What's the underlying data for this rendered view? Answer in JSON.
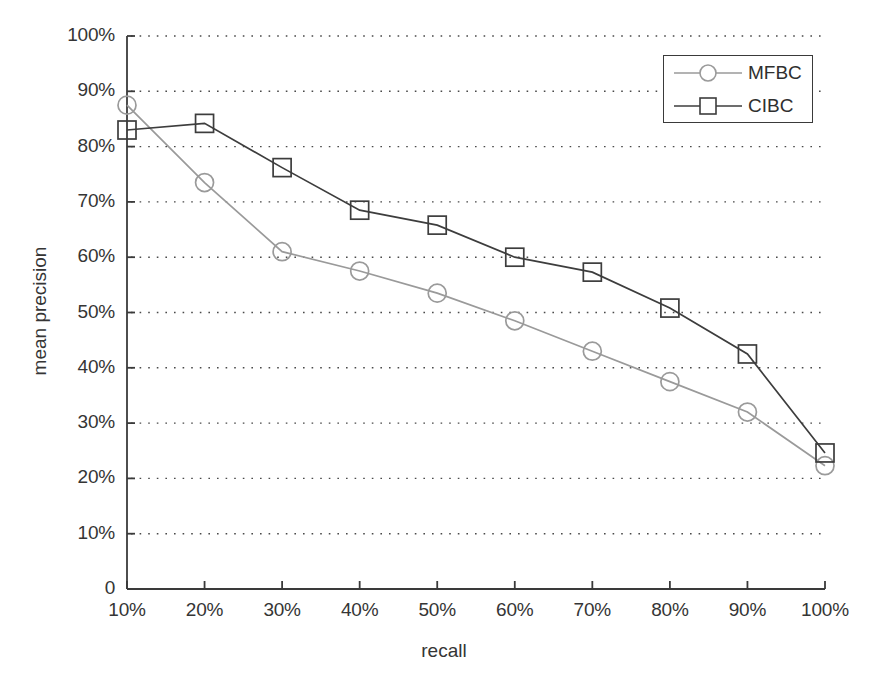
{
  "chart_data": {
    "type": "line",
    "title": "",
    "xlabel": "recall",
    "ylabel": "mean precision",
    "categories": [
      "10%",
      "20%",
      "30%",
      "40%",
      "50%",
      "60%",
      "70%",
      "80%",
      "90%",
      "100%"
    ],
    "x": [
      10,
      20,
      30,
      40,
      50,
      60,
      70,
      80,
      90,
      100
    ],
    "xlim": [
      10,
      100
    ],
    "ylim": [
      0,
      100
    ],
    "xtick_labels": [
      "10%",
      "20%",
      "30%",
      "40%",
      "50%",
      "60%",
      "70%",
      "80%",
      "90%",
      "100%"
    ],
    "ytick_labels": [
      "0",
      "10%",
      "20%",
      "30%",
      "40%",
      "50%",
      "60%",
      "70%",
      "80%",
      "90%",
      "100%"
    ],
    "ytick_values": [
      0,
      10,
      20,
      30,
      40,
      50,
      60,
      70,
      80,
      90,
      100
    ],
    "grid": "horizontal-dotted",
    "legend_position": "top-right",
    "series": [
      {
        "name": "MFBC",
        "marker": "circle",
        "color": "#9a9a9a",
        "values": [
          87.5,
          73.5,
          61.0,
          57.5,
          53.5,
          48.5,
          43.0,
          37.5,
          32.0,
          22.3
        ]
      },
      {
        "name": "CIBC",
        "marker": "square",
        "color": "#3d3d3d",
        "values": [
          83.0,
          84.2,
          76.2,
          68.5,
          65.8,
          60.0,
          57.3,
          50.8,
          42.5,
          24.6
        ]
      }
    ]
  },
  "axes": {
    "x_title": "recall",
    "y_title": "mean precision"
  },
  "legend": {
    "entries": [
      {
        "label": "MFBC",
        "marker": "circle-marker"
      },
      {
        "label": "CIBC",
        "marker": "square-marker"
      }
    ]
  },
  "colors": {
    "mfbc_line": "#9a9a9a",
    "cibc_line": "#3d3d3d",
    "axis": "#3a3a3a",
    "grid": "#4a4a4a",
    "background": "#ffffff"
  }
}
